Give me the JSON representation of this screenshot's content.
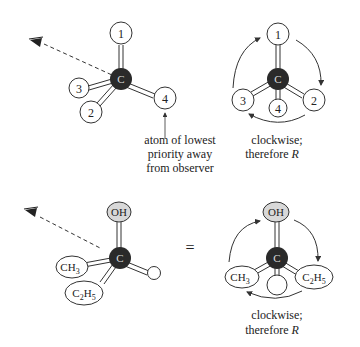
{
  "diagram": {
    "top_left": {
      "center": "C",
      "substituents": [
        "1",
        "2",
        "3",
        "4"
      ],
      "caption": [
        "atom of lowest",
        "priority away",
        "from observer"
      ]
    },
    "top_right": {
      "center": "C",
      "substituents": [
        "1",
        "2",
        "3",
        "4"
      ],
      "caption": [
        "clockwise;",
        "therefore "
      ],
      "caption_italic": "R"
    },
    "bottom_left": {
      "center": "C",
      "groups": {
        "oh": "OH",
        "ch3": "CH",
        "ch3_sub": "3",
        "c2h5_a": "C",
        "c2h5_sub1": "2",
        "c2h5_b": "H",
        "c2h5_sub2": "5"
      }
    },
    "equals": "=",
    "bottom_right": {
      "center": "C",
      "groups": {
        "oh": "OH",
        "ch3": "CH",
        "ch3_sub": "3",
        "c2h5_a": "C",
        "c2h5_sub1": "2",
        "c2h5_b": "H",
        "c2h5_sub2": "5"
      },
      "caption": [
        "clockwise;",
        "therefore "
      ],
      "caption_italic": "R"
    },
    "colors": {
      "carbon": "#2a2a2a",
      "oh_fill": "#d8d8d8",
      "line": "#333333"
    }
  }
}
